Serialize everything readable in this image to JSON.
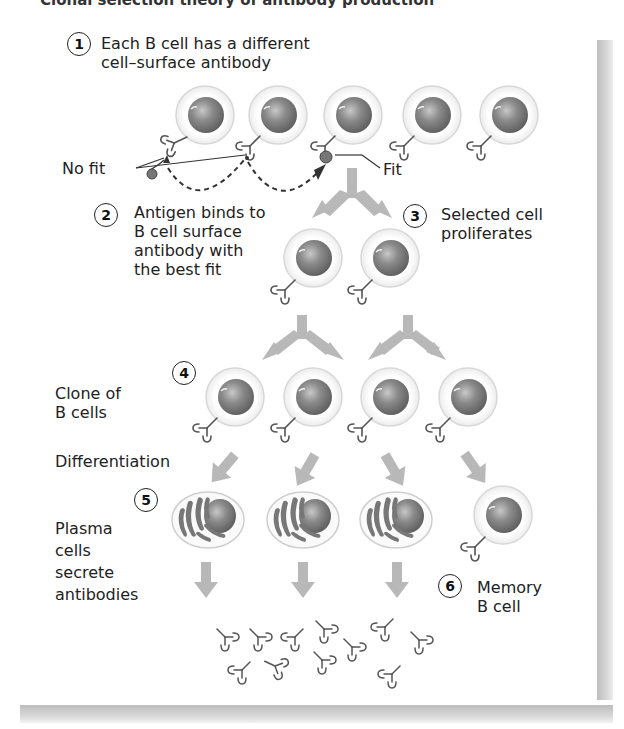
{
  "header": {
    "cut_title": "Clonal selection theory of antibody production"
  },
  "steps": [
    {
      "number": "1",
      "text_lines": [
        "Each B cell has a different",
        "cell–surface antibody"
      ]
    },
    {
      "number": "2",
      "text_lines": [
        "Antigen binds to",
        "B cell surface",
        "antibody with",
        "the best fit"
      ]
    },
    {
      "number": "3",
      "text_lines": [
        "Selected cell",
        "proliferates"
      ]
    },
    {
      "number": "4",
      "text_lines": []
    },
    {
      "number": "5",
      "text_lines": []
    },
    {
      "number": "6",
      "text_lines": [
        "Memory",
        "B cell"
      ]
    }
  ],
  "labels": {
    "no_fit": "No fit",
    "fit": "Fit",
    "clone": [
      "Clone of",
      "B cells"
    ],
    "differentiation": "Differentiation",
    "plasma": [
      "Plasma",
      "cells",
      "secrete",
      "antibodies"
    ]
  },
  "colors": {
    "arrow": "#b8b8b8",
    "nucleus": "#7a7a7a",
    "cell_halo": "#f0f0f0",
    "shadow": "#c4c4c4",
    "text": "#222222"
  }
}
